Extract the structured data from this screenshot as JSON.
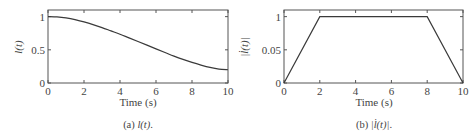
{
  "chart_data": [
    {
      "type": "line",
      "panel": "a",
      "caption": "(a) l(t).",
      "caption_prefix": "(a) ",
      "caption_math": "l(t)",
      "caption_suffix": ".",
      "xlabel": "Time (s)",
      "ylabel": "l(t)",
      "xlim": [
        0,
        10
      ],
      "ylim": [
        0,
        1.1
      ],
      "xticks": [
        0,
        2,
        4,
        6,
        8,
        10
      ],
      "xtick_labels": [
        "0",
        "2",
        "4",
        "6",
        "8",
        "10"
      ],
      "yticks": [
        0,
        0.5,
        1
      ],
      "ytick_labels": [
        "0",
        "0.5",
        "1"
      ],
      "grid": false,
      "series": [
        {
          "name": "l(t)",
          "color": "#3a3a3a",
          "x": [
            0,
            0.5,
            1,
            1.5,
            2,
            2.5,
            3,
            3.5,
            4,
            4.5,
            5,
            5.5,
            6,
            6.5,
            7,
            7.5,
            8,
            8.5,
            9,
            9.5,
            10
          ],
          "y": [
            1.0,
            0.995,
            0.98,
            0.955,
            0.92,
            0.88,
            0.835,
            0.785,
            0.735,
            0.68,
            0.625,
            0.57,
            0.515,
            0.46,
            0.405,
            0.355,
            0.31,
            0.27,
            0.235,
            0.21,
            0.2
          ]
        }
      ]
    },
    {
      "type": "line",
      "panel": "b",
      "caption": "(b) |l̇(t)|.",
      "caption_prefix": "(b) ",
      "caption_math": "|l̇(t)|",
      "caption_suffix": ".",
      "xlabel": "Time (s)",
      "ylabel": "|l̇(t)|",
      "xlim": [
        0,
        10
      ],
      "ylim": [
        0,
        1.1
      ],
      "xticks": [
        0,
        2,
        4,
        6,
        8,
        10
      ],
      "xtick_labels": [
        "0",
        "2",
        "4",
        "6",
        "8",
        "10"
      ],
      "yticks": [
        0,
        0.5,
        1
      ],
      "ytick_labels": [
        "0",
        "0.05",
        "1"
      ],
      "grid": false,
      "series": [
        {
          "name": "|l̇(t)|",
          "color": "#3a3a3a",
          "x": [
            0,
            2,
            8,
            10
          ],
          "y": [
            0,
            1,
            1,
            0
          ]
        }
      ]
    }
  ]
}
